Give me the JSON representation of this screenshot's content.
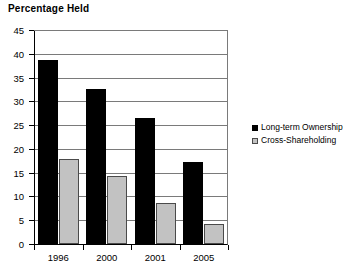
{
  "chart_data": {
    "type": "bar",
    "title": "Percentage Held",
    "xlabel": "",
    "ylabel": "",
    "ylim": [
      0,
      45
    ],
    "ytick_step": 5,
    "yticks": [
      45,
      40,
      35,
      30,
      25,
      20,
      15,
      10,
      5,
      0
    ],
    "grid": true,
    "legend_position": "right",
    "categories": [
      "1996",
      "2000",
      "2001",
      "2005"
    ],
    "series": [
      {
        "name": "Long-term Ownership",
        "color": "#000000",
        "values": [
          38.7,
          32.5,
          26.4,
          17.2
        ]
      },
      {
        "name": "Cross-Shareholding",
        "color": "#c2c2c2",
        "values": [
          17.8,
          14.2,
          8.6,
          4.3
        ]
      }
    ]
  }
}
